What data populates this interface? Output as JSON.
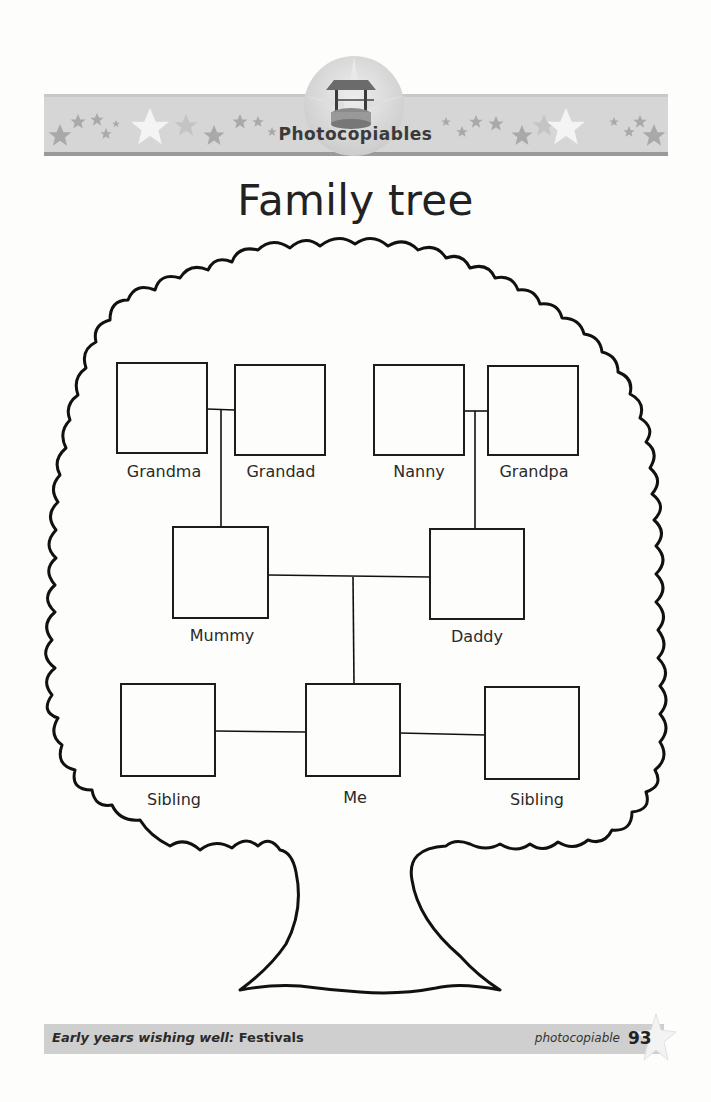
{
  "header": {
    "banner_title": "Photocopiables",
    "emblem_icon": "wishing-well-icon",
    "banner_color": "#d6d6d6"
  },
  "page": {
    "title": "Family tree"
  },
  "tree": {
    "rows": [
      {
        "row": "grandparents",
        "members": [
          {
            "label": "Grandma"
          },
          {
            "label": "Grandad"
          },
          {
            "label": "Nanny"
          },
          {
            "label": "Grandpa"
          }
        ]
      },
      {
        "row": "parents",
        "members": [
          {
            "label": "Mummy"
          },
          {
            "label": "Daddy"
          }
        ]
      },
      {
        "row": "children",
        "members": [
          {
            "label": "Sibling"
          },
          {
            "label": "Me"
          },
          {
            "label": "Sibling"
          }
        ]
      }
    ]
  },
  "footer": {
    "book_title_prefix": "Early years wishing well: ",
    "book_title_bold": "Festivals",
    "note": "photocopiable",
    "page_number": "93"
  }
}
